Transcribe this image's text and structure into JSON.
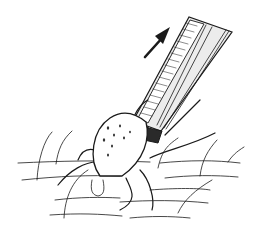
{
  "figure": {
    "elements": [
      "tweezers",
      "tick",
      "skin-hairs",
      "upward-arrow"
    ],
    "colors": {
      "ink": "#1a1a1a",
      "background": "#ffffff",
      "tweezer_fill": "#e8e8e8"
    }
  }
}
